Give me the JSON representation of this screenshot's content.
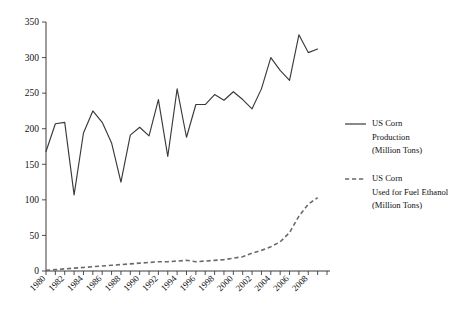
{
  "chart_data": {
    "type": "line",
    "title": "",
    "xlabel": "",
    "ylabel": "",
    "xlim": [
      1980,
      2010
    ],
    "ylim": [
      0,
      350
    ],
    "yticks": [
      0,
      50,
      100,
      150,
      200,
      250,
      300,
      350
    ],
    "ytick_labels": [
      "0",
      "50",
      "100",
      "150",
      "200",
      "250",
      "300",
      "350"
    ],
    "xticks": [
      1980,
      1982,
      1984,
      1986,
      1988,
      1990,
      1992,
      1994,
      1996,
      1998,
      2000,
      2002,
      2004,
      2006,
      2008
    ],
    "xtick_labels": [
      "1980",
      "1982",
      "1984",
      "1986",
      "1988",
      "1990",
      "1992",
      "1994",
      "1996",
      "1998",
      "2000",
      "2002",
      "2004",
      "2006",
      "2008"
    ],
    "xtick_minor_interval": 1,
    "grid": false,
    "legend_position": "right",
    "x": [
      1980,
      1981,
      1982,
      1983,
      1984,
      1985,
      1986,
      1987,
      1988,
      1989,
      1990,
      1991,
      1992,
      1993,
      1994,
      1995,
      1996,
      1997,
      1998,
      1999,
      2000,
      2001,
      2002,
      2003,
      2004,
      2005,
      2006,
      2007,
      2008,
      2009
    ],
    "series": [
      {
        "name": "US Corn Production (Million Tons)",
        "style": "solid",
        "color": "#3a3a3a",
        "values": [
          168,
          207,
          209,
          107,
          194,
          225,
          209,
          180,
          125,
          191,
          202,
          190,
          241,
          161,
          256,
          188,
          234,
          234,
          248,
          240,
          252,
          241,
          228,
          256,
          300,
          282,
          268,
          332,
          307,
          312
        ]
      },
      {
        "name": "US Corn Used for Fuel Ethanol (Million Tons)",
        "style": "dashed",
        "color": "#6a6a6a",
        "values": [
          1,
          2,
          3,
          4,
          5,
          6,
          7,
          8,
          9,
          10,
          11,
          12,
          13,
          13,
          14,
          15,
          13,
          14,
          15,
          16,
          18,
          20,
          25,
          29,
          34,
          41,
          54,
          77,
          94,
          103
        ]
      }
    ],
    "legend_entries": [
      {
        "line1": "US Corn",
        "line2": "Production",
        "line3": "(Million Tons)",
        "style": "solid"
      },
      {
        "line1": "US Corn",
        "line2": "Used for Fuel Ethanol",
        "line3": "(Million Tons)",
        "style": "dashed"
      }
    ]
  }
}
